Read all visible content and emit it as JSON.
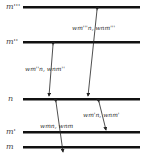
{
  "diagram": {
    "title": "",
    "levels": [
      {
        "id": "m3",
        "label": "m'''",
        "y": 7
      },
      {
        "id": "m2",
        "label": "m''",
        "y": 42
      },
      {
        "id": "n",
        "label": "n",
        "y": 99
      },
      {
        "id": "m1",
        "label": "m'",
        "y": 132
      },
      {
        "id": "m0",
        "label": "m",
        "y": 147
      }
    ],
    "transitions": [
      {
        "from": "m''",
        "to": "n",
        "label": "wₘ″ₙ, wₙₘ″",
        "label_text": "wm''n, wnm''"
      },
      {
        "from": "m'''",
        "to": "n",
        "label_text": "wm'''n, wnm'''"
      },
      {
        "from": "m",
        "to": "n",
        "label_text": "wmn, wnm"
      },
      {
        "from": "m'",
        "to": "n",
        "label_text": "wm'n, wnm'"
      }
    ],
    "colors": {
      "line": "#111111",
      "text": "#333333",
      "background": "#ffffff"
    }
  }
}
